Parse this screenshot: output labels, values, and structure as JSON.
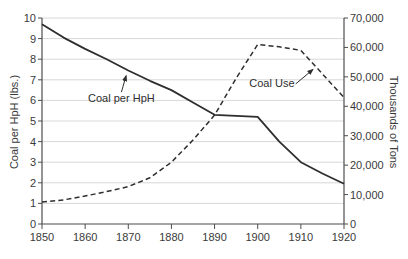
{
  "figure": {
    "background": "#ffffff",
    "axis_color": "#4d4d4d",
    "grid_color": "#d8d8d8",
    "line_color": "#2e2e2e",
    "text_color": "#3a3a3a"
  },
  "left_axis": {
    "title": "Coal per HpH (lbs.)",
    "tick_values": [
      0,
      1,
      2,
      3,
      4,
      5,
      6,
      7,
      8,
      9,
      10
    ],
    "tick_labels": [
      "0",
      "1",
      "2",
      "3",
      "4",
      "5",
      "6",
      "7",
      "8",
      "9",
      "10"
    ]
  },
  "right_axis": {
    "title": "Thousands of Tons",
    "tick_values": [
      0,
      10000,
      20000,
      30000,
      40000,
      50000,
      60000,
      70000
    ],
    "tick_labels": [
      "0",
      "10,000",
      "20,000",
      "30,000",
      "40,000",
      "50,000",
      "60,000",
      "70,000"
    ]
  },
  "x_axis": {
    "tick_values": [
      1850,
      1860,
      1870,
      1880,
      1890,
      1900,
      1910,
      1920
    ],
    "tick_labels": [
      "1850",
      "1860",
      "1870",
      "1880",
      "1890",
      "1900",
      "1910",
      "1920"
    ]
  },
  "annotations": [
    {
      "text": "Coal per HpH",
      "text_at": {
        "year": 1868.4,
        "left_value": 6.1
      },
      "arrow_from": {
        "year": 1868.4,
        "left_value": 6.4
      },
      "arrow_to": {
        "year": 1869.5,
        "left_value": 7.2
      }
    },
    {
      "text": "Coal Use",
      "text_at": {
        "year": 1903.3,
        "left_value": 6.85
      },
      "arrow_from": {
        "year": 1908.8,
        "left_value": 6.8
      },
      "arrow_to": {
        "year": 1912.8,
        "left_value": 7.5
      }
    }
  ],
  "chart_data": {
    "type": "line",
    "title": "",
    "xlabel": "",
    "left_ylabel": "Coal per HpH (lbs.)",
    "right_ylabel": "Thousands of Tons",
    "xlim": [
      1850,
      1920
    ],
    "left_ylim": [
      0,
      10
    ],
    "right_ylim": [
      0,
      70000
    ],
    "grid": "horizontal",
    "x": [
      1850,
      1855,
      1860,
      1865,
      1870,
      1875,
      1880,
      1885,
      1890,
      1895,
      1900,
      1905,
      1910,
      1915,
      1920
    ],
    "series": [
      {
        "name": "Coal per HpH",
        "axis": "left",
        "style": "solid",
        "units": "lbs.",
        "values": [
          9.7,
          9.05,
          8.5,
          8.0,
          7.45,
          6.95,
          6.5,
          5.9,
          5.3,
          5.25,
          5.2,
          4.0,
          3.0,
          2.45,
          1.95
        ]
      },
      {
        "name": "Coal Use",
        "axis": "right",
        "style": "dashed",
        "units": "thousands of tons",
        "values": [
          7500,
          8200,
          9500,
          11000,
          12700,
          15700,
          21000,
          28500,
          37000,
          49500,
          61000,
          60200,
          59000,
          51000,
          43000
        ]
      }
    ]
  }
}
